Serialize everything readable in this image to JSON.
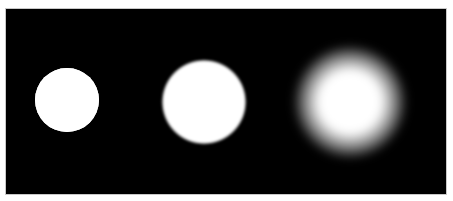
{
  "image": {
    "description": "Three white discs on a black background with increasing blur from left to right",
    "background_color": "#000000",
    "frame_color": "#c8c8c8",
    "panel": {
      "x": 6,
      "y": 9,
      "width": 440,
      "height": 185
    },
    "discs": [
      {
        "label": "sharp-disc",
        "cx": 67,
        "cy": 100,
        "radius": 32,
        "blur": 0.6,
        "core_radius": 32,
        "color": "#ffffff"
      },
      {
        "label": "slightly-blurred-disc",
        "cx": 204,
        "cy": 102,
        "radius": 43,
        "blur": 3,
        "core_radius": 40,
        "color": "#ffffff"
      },
      {
        "label": "heavily-blurred-disc",
        "cx": 350,
        "cy": 102,
        "radius": 58,
        "blur": 12,
        "core_radius": 30,
        "color": "#ffffff"
      }
    ]
  }
}
